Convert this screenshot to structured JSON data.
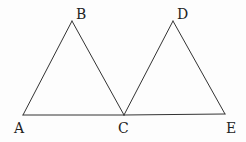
{
  "diagram": {
    "type": "geometry",
    "points": {
      "A": {
        "label": "A",
        "x": 23,
        "y": 115,
        "label_x": 14,
        "label_y": 133
      },
      "B": {
        "label": "B",
        "x": 72,
        "y": 21,
        "label_x": 76,
        "label_y": 19
      },
      "C": {
        "label": "C",
        "x": 124,
        "y": 115,
        "label_x": 118,
        "label_y": 133
      },
      "D": {
        "label": "D",
        "x": 173,
        "y": 21,
        "label_x": 177,
        "label_y": 19
      },
      "E": {
        "label": "E",
        "x": 225,
        "y": 114,
        "label_x": 226,
        "label_y": 133
      }
    },
    "segments": [
      {
        "from": "A",
        "to": "B"
      },
      {
        "from": "B",
        "to": "C"
      },
      {
        "from": "A",
        "to": "C"
      },
      {
        "from": "C",
        "to": "D"
      },
      {
        "from": "D",
        "to": "E"
      },
      {
        "from": "C",
        "to": "E"
      }
    ],
    "colors": {
      "line": "#333333",
      "text": "#222222",
      "background": "#fdfdfd"
    }
  }
}
